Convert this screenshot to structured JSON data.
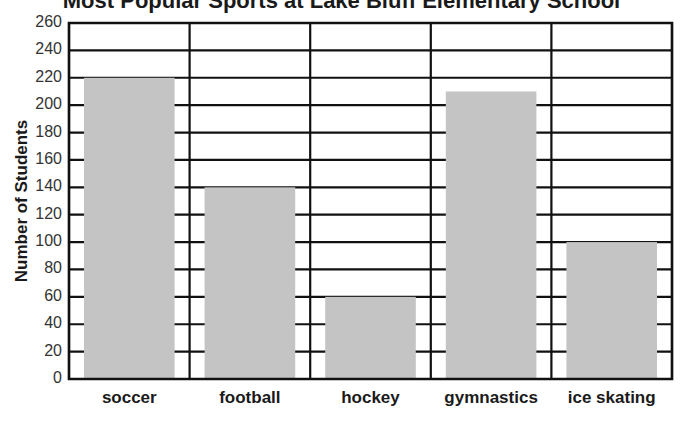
{
  "chart_data": {
    "type": "bar",
    "title": "Most Popular Sports at Lake Bluff Elementary School",
    "xlabel": "",
    "ylabel": "Number of Students",
    "categories": [
      "soccer",
      "football",
      "hockey",
      "gymnastics",
      "ice skating"
    ],
    "values": [
      220,
      140,
      60,
      210,
      100
    ],
    "ylim": [
      0,
      260
    ],
    "yticks": [
      0,
      20,
      40,
      60,
      80,
      100,
      120,
      140,
      160,
      180,
      200,
      220,
      240,
      260
    ],
    "grid": true,
    "legend": null,
    "colors": {
      "bar": "#c4c4c4",
      "grid": "#111111",
      "background": "#ffffff"
    }
  }
}
